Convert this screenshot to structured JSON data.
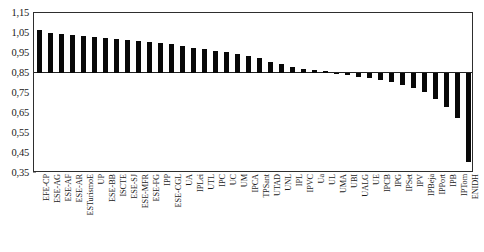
{
  "chart_data": {
    "type": "bar",
    "title": "",
    "subtitle": "",
    "xlabel": "",
    "ylabel": "",
    "ylim": [
      0.35,
      1.15
    ],
    "yticks": [
      "1,15",
      "1,05",
      "0,95",
      "0,85",
      "0,75",
      "0,65",
      "0,55",
      "0,45",
      "0,35"
    ],
    "ytick_values": [
      1.15,
      1.05,
      0.95,
      0.85,
      0.75,
      0.65,
      0.55,
      0.45,
      0.35
    ],
    "baseline": 0.85,
    "grid": false,
    "legend": "none",
    "decimal_separator": ",",
    "bar_color": "#080808",
    "axis_color": "#2e2e2e",
    "categories": [
      "EFE-CP",
      "ESE-AG",
      "ESE-AF",
      "ESE-AR",
      "ESTurismoE",
      "UP",
      "ESE-BB",
      "ISCTE",
      "ESE-SJ",
      "ESE-MFR",
      "ESE-FG",
      "IPP",
      "ESE-CGL",
      "UA",
      "IPLei",
      "UTL",
      "IPC",
      "UC",
      "UM",
      "IPCA",
      "TPSant",
      "UTAD",
      "UNL",
      "IPL",
      "IPVC",
      "Ua",
      "UL",
      "UMA",
      "UBI",
      "UALG",
      "UE",
      "IPCB",
      "IPG",
      "IPSet",
      "IPV",
      "IPBeja",
      "IPPort",
      "IPB",
      "IPTom",
      "ENIDH"
    ],
    "values": [
      1.065,
      1.05,
      1.045,
      1.04,
      1.035,
      1.03,
      1.025,
      1.02,
      1.015,
      1.01,
      1.005,
      1.0,
      0.995,
      0.985,
      0.975,
      0.97,
      0.96,
      0.955,
      0.945,
      0.935,
      0.925,
      0.905,
      0.895,
      0.88,
      0.872,
      0.866,
      0.858,
      0.852,
      0.84,
      0.832,
      0.825,
      0.815,
      0.805,
      0.79,
      0.775,
      0.755,
      0.72,
      0.68,
      0.625,
      0.405
    ]
  }
}
